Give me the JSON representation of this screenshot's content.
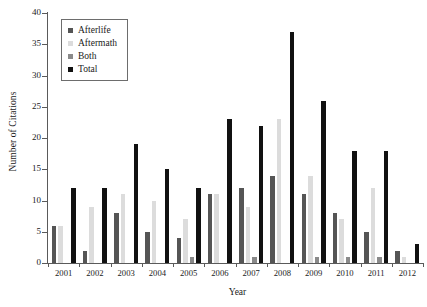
{
  "chart_data": {
    "type": "bar",
    "title": "",
    "xlabel": "Year",
    "ylabel": "Number of Citations",
    "categories": [
      "2001",
      "2002",
      "2003",
      "2004",
      "2005",
      "2006",
      "2007",
      "2008",
      "2009",
      "2010",
      "2011",
      "2012"
    ],
    "series": [
      {
        "name": "Afterlife",
        "color": "#555555",
        "values": [
          6,
          2,
          8,
          5,
          4,
          11,
          12,
          14,
          11,
          8,
          5,
          2
        ]
      },
      {
        "name": "Aftermath",
        "color": "#dcdcdc",
        "values": [
          6,
          9,
          11,
          10,
          7,
          11,
          9,
          23,
          14,
          7,
          12,
          1
        ]
      },
      {
        "name": "Both",
        "color": "#8a8a8a",
        "values": [
          0,
          0,
          0,
          0,
          1,
          0,
          1,
          0,
          1,
          1,
          1,
          0
        ]
      },
      {
        "name": "Total",
        "color": "#111111",
        "values": [
          12,
          12,
          19,
          15,
          12,
          23,
          22,
          37,
          26,
          18,
          18,
          3
        ]
      }
    ],
    "ylim": [
      0,
      40
    ],
    "yticks": [
      0,
      5,
      10,
      15,
      20,
      25,
      30,
      35,
      40
    ],
    "grid": false,
    "legend_position": "top-left"
  },
  "legend": {
    "items": [
      {
        "label": "Afterlife"
      },
      {
        "label": "Aftermath"
      },
      {
        "label": "Both"
      },
      {
        "label": "Total"
      }
    ]
  }
}
